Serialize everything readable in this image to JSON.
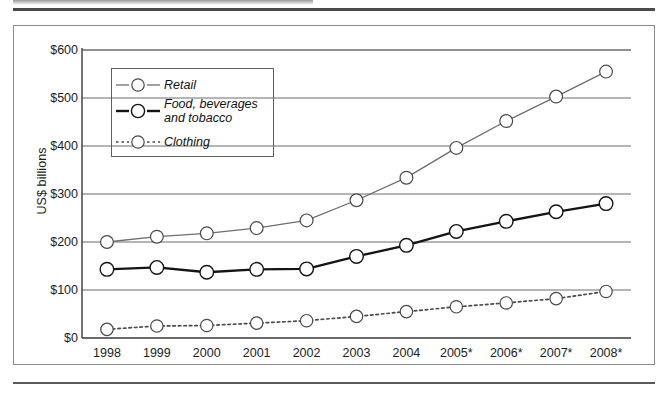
{
  "figure": {
    "ylabel": "US$ billions",
    "y_ticks": [
      "$600",
      "$500",
      "$400",
      "$300",
      "$200",
      "$100",
      "$0"
    ],
    "x_ticks": [
      "1998",
      "1999",
      "2000",
      "2001",
      "2002",
      "2003",
      "2004",
      "2005*",
      "2006*",
      "2007*",
      "2008*"
    ],
    "legend": [
      {
        "label": "Retail",
        "style": "solid-light"
      },
      {
        "label": "Food, beverages\nand tobacco",
        "style": "solid-bold"
      },
      {
        "label": "Clothing",
        "style": "dotted"
      }
    ]
  },
  "colors": {
    "retail": "#6e6e6e",
    "food": "#141414",
    "clothing": "#4a4a4a",
    "grid": "#6d6d6d",
    "axis": "#3a3a3a",
    "frame": "#8b8b8b",
    "marker_fill": "#ffffff",
    "text": "#1c1c1c"
  },
  "chart_data": {
    "type": "line",
    "title": "",
    "xlabel": "",
    "ylabel": "US$ billions",
    "ylim": [
      0,
      600
    ],
    "ytick_values": [
      0,
      100,
      200,
      300,
      400,
      500,
      600
    ],
    "grid": true,
    "legend_position": "upper-left-inside",
    "categories": [
      "1998",
      "1999",
      "2000",
      "2001",
      "2002",
      "2003",
      "2004",
      "2005*",
      "2006*",
      "2007*",
      "2008*"
    ],
    "series": [
      {
        "name": "Retail",
        "values": [
          200,
          211,
          218,
          229,
          245,
          287,
          334,
          396,
          452,
          503,
          555
        ]
      },
      {
        "name": "Food, beverages and tobacco",
        "values": [
          143,
          147,
          137,
          143,
          144,
          170,
          193,
          222,
          243,
          263,
          280
        ]
      },
      {
        "name": "Clothing",
        "values": [
          18,
          25,
          26,
          31,
          36,
          45,
          55,
          65,
          73,
          82,
          97
        ]
      }
    ]
  }
}
